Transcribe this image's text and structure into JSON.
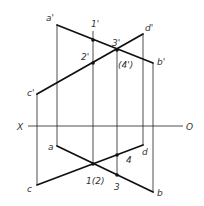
{
  "diagram": {
    "title": "",
    "axis": {
      "left_label": "X",
      "right_label": "O"
    },
    "labels": {
      "a_prime": "a'",
      "b_prime": "b'",
      "c_prime": "c'",
      "d_prime": "d'",
      "p1_prime": "1'",
      "p2_prime": "2'",
      "p3_prime": "3'",
      "p4_prime": "(4')",
      "a": "a",
      "b": "b",
      "c": "c",
      "d": "d",
      "p12": "1(2)",
      "p3": "3",
      "p4": "4"
    },
    "colors": {
      "line": "#111111",
      "text": "#333333",
      "background": "#ffffff"
    }
  }
}
